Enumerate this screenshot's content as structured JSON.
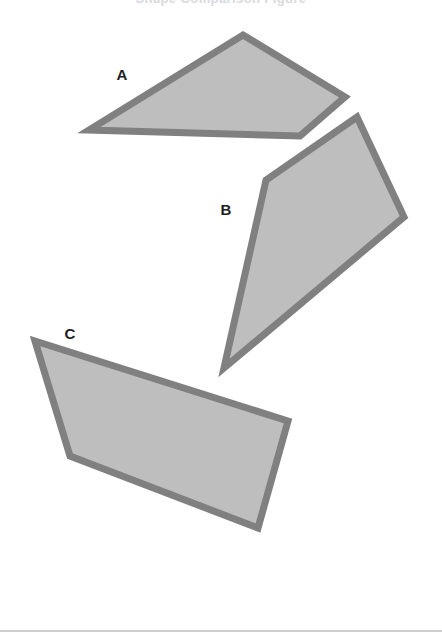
{
  "page": {
    "width": 442,
    "height": 641,
    "background_color": "#FFFFFF",
    "title": "Shape Comparison Figure"
  },
  "figure": {
    "shape_fill_color": "#BEBEBE",
    "shape_stroke_color": "#808080",
    "shape_stroke_width": 7,
    "label_color": "#1D1D1D",
    "labels": [
      {
        "text": "A",
        "x": 122,
        "y": 74
      },
      {
        "text": "B",
        "x": 226,
        "y": 209
      },
      {
        "text": "C",
        "x": 70,
        "y": 333
      }
    ],
    "shapes": [
      {
        "id": "A",
        "type": "quadrilateral",
        "points": "243,35 345,97 300,136 89,130"
      },
      {
        "id": "B",
        "type": "quadrilateral",
        "points": "357,117 404,217 224,368 266,180"
      },
      {
        "id": "C",
        "type": "quadrilateral",
        "points": "35,341 288,421 258,528 70,456"
      }
    ]
  },
  "divider": {
    "y": 630,
    "color": "#CDCDD1"
  }
}
